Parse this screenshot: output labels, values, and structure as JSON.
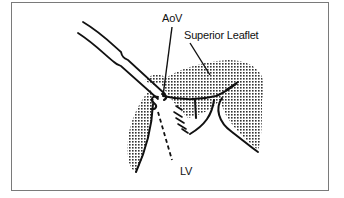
{
  "figure": {
    "labels": {
      "aov": "AoV",
      "superior_leaflet": "Superior Leaflet",
      "lv": "LV"
    },
    "colors": {
      "line": "#111111",
      "stipple": "#333333",
      "frame": "#7a7a7a",
      "background": "#ffffff"
    }
  }
}
